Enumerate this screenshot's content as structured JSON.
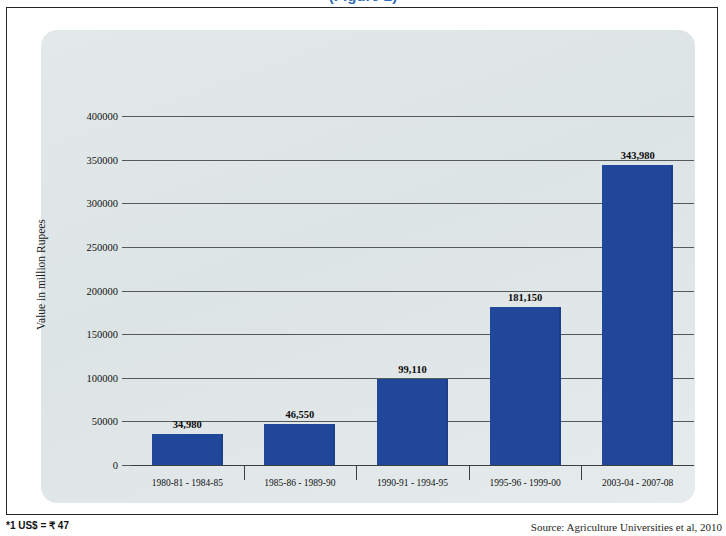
{
  "title_partial": "(Figure 2)",
  "footnotes": {
    "left": "*1 US$ = ₹ 47",
    "right": "Source: Agriculture Universities et al, 2010"
  },
  "chart_data": {
    "type": "bar",
    "title": "",
    "xlabel": "",
    "ylabel": "Value in million Rupees",
    "categories": [
      "1980-81 - 1984-85",
      "1985-86 - 1989-90",
      "1990-91 - 1994-95",
      "1995-96 - 1999-00",
      "2003-04 - 2007-08"
    ],
    "values": [
      34980,
      46550,
      99110,
      181150,
      343980
    ],
    "value_labels": [
      "34,980",
      "46,550",
      "99,110",
      "181,150",
      "343,980"
    ],
    "ylim": [
      0,
      400000
    ],
    "yticks": [
      0,
      50000,
      100000,
      150000,
      200000,
      250000,
      300000,
      350000,
      400000
    ],
    "ytick_labels": [
      "0",
      "50000",
      "100000",
      "150000",
      "200000",
      "250000",
      "300000",
      "350000",
      "400000"
    ],
    "grid": true,
    "legend": false,
    "bar_color": "#21479b",
    "panel_color": "#dde4e6",
    "gridline_color": "#56595b"
  }
}
